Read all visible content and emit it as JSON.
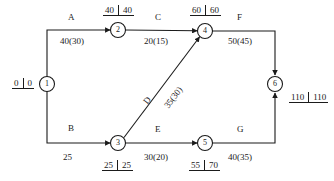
{
  "diagram": {
    "type": "activity-on-arrow-network",
    "title": "",
    "nodes": [
      {
        "id": "1",
        "label": "1",
        "x": 47,
        "y": 84,
        "early": "0",
        "late": "0",
        "box_pos": "left"
      },
      {
        "id": "2",
        "label": "2",
        "x": 118,
        "y": 30,
        "early": "40",
        "late": "40",
        "box_pos": "above"
      },
      {
        "id": "3",
        "label": "3",
        "x": 118,
        "y": 143,
        "early": "25",
        "late": "25",
        "box_pos": "below"
      },
      {
        "id": "4",
        "label": "4",
        "x": 205,
        "y": 31,
        "early": "60",
        "late": "60",
        "box_pos": "above"
      },
      {
        "id": "5",
        "label": "5",
        "x": 205,
        "y": 143,
        "early": "55",
        "late": "70",
        "box_pos": "below"
      },
      {
        "id": "6",
        "label": "6",
        "x": 275,
        "y": 84,
        "early": "110",
        "late": "110",
        "box_pos": "right"
      }
    ],
    "edges": [
      {
        "name": "A",
        "from": "1",
        "to": "2",
        "duration": "40(30)"
      },
      {
        "name": "B",
        "from": "1",
        "to": "3",
        "duration": "25"
      },
      {
        "name": "C",
        "from": "2",
        "to": "4",
        "duration": "20(15)"
      },
      {
        "name": "D",
        "from": "3",
        "to": "4",
        "duration": "35(30)"
      },
      {
        "name": "E",
        "from": "3",
        "to": "5",
        "duration": "30(20)"
      },
      {
        "name": "F",
        "from": "4",
        "to": "6",
        "duration": "50(45)"
      },
      {
        "name": "G",
        "from": "5",
        "to": "6",
        "duration": "40(35)"
      }
    ],
    "edge_labels": {
      "a_name": "A",
      "a_dur": "40(30)",
      "b_name": "B",
      "b_dur": "25",
      "c_name": "C",
      "c_dur": "20(15)",
      "d_name": "D",
      "d_dur": "35(30)",
      "e_name": "E",
      "e_dur": "30(20)",
      "f_name": "F",
      "f_dur": "50(45)",
      "g_name": "G",
      "g_dur": "40(35)"
    },
    "node_labels": {
      "n1": "1",
      "n2": "2",
      "n3": "3",
      "n4": "4",
      "n5": "5",
      "n6": "6"
    },
    "time_boxes": {
      "t1_e": "0",
      "t1_l": "0",
      "t2_e": "40",
      "t2_l": "40",
      "t3_e": "25",
      "t3_l": "25",
      "t4_e": "60",
      "t4_l": "60",
      "t5_e": "55",
      "t5_l": "70",
      "t6_e": "110",
      "t6_l": "110"
    },
    "colors": {
      "line": "#1b1b1b",
      "text": "#1b1b1b",
      "background": "#ffffff"
    }
  }
}
